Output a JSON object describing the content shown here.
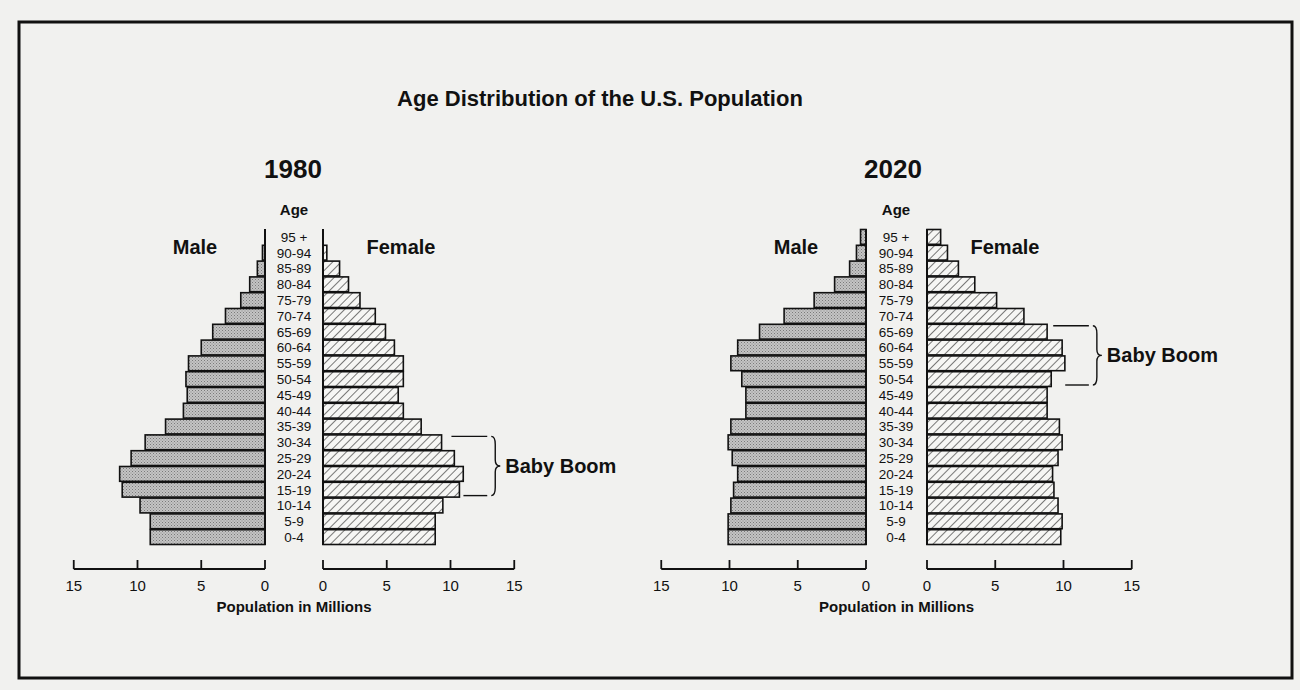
{
  "title": "Age Distribution of the U.S. Population",
  "colors": {
    "background": "#f1f1ef",
    "ink": "#111111",
    "male_fill": "#bdbdbd",
    "female_fill": "#f4f4f2"
  },
  "age_label": "Age",
  "male_label": "Male",
  "female_label": "Female",
  "axis_label": "Population in Millions",
  "annotation_label": "Baby Boom",
  "chart_data": [
    {
      "type": "bar",
      "subtype": "population-pyramid",
      "title": "1980",
      "categories": [
        "95 +",
        "90-94",
        "85-89",
        "80-84",
        "75-79",
        "70-74",
        "65-69",
        "60-64",
        "55-59",
        "50-54",
        "45-49",
        "40-44",
        "35-39",
        "30-34",
        "25-29",
        "20-24",
        "15-19",
        "10-14",
        "5-9",
        "0-4"
      ],
      "series": [
        {
          "name": "Male",
          "values": [
            0.0,
            0.2,
            0.6,
            1.2,
            1.9,
            3.1,
            4.1,
            5.0,
            6.0,
            6.2,
            6.1,
            6.4,
            7.8,
            9.4,
            10.5,
            11.4,
            11.2,
            9.8,
            9.0,
            9.0
          ]
        },
        {
          "name": "Female",
          "values": [
            0.0,
            0.3,
            1.3,
            2.0,
            2.9,
            4.1,
            4.9,
            5.6,
            6.3,
            6.3,
            5.9,
            6.3,
            7.7,
            9.3,
            10.3,
            11.0,
            10.7,
            9.4,
            8.8,
            8.8
          ]
        }
      ],
      "xlabel": "Population in Millions",
      "ylabel": "Age",
      "xlim": [
        0,
        15
      ],
      "xticks": [
        0,
        5,
        10,
        15
      ],
      "grid": false,
      "annotation": {
        "text": "Baby Boom",
        "from": "30-34",
        "to": "15-19",
        "side": "Female"
      }
    },
    {
      "type": "bar",
      "subtype": "population-pyramid",
      "title": "2020",
      "categories": [
        "95 +",
        "90-94",
        "85-89",
        "80-84",
        "75-79",
        "70-74",
        "65-69",
        "60-64",
        "55-59",
        "50-54",
        "45-49",
        "40-44",
        "35-39",
        "30-34",
        "25-29",
        "20-24",
        "15-19",
        "10-14",
        "5-9",
        "0-4"
      ],
      "series": [
        {
          "name": "Male",
          "values": [
            0.4,
            0.7,
            1.2,
            2.3,
            3.8,
            6.0,
            7.8,
            9.4,
            9.9,
            9.1,
            8.8,
            8.8,
            9.9,
            10.1,
            9.8,
            9.4,
            9.7,
            9.9,
            10.1,
            10.1
          ]
        },
        {
          "name": "Female",
          "values": [
            1.0,
            1.5,
            2.3,
            3.5,
            5.1,
            7.1,
            8.8,
            9.9,
            10.1,
            9.1,
            8.8,
            8.8,
            9.7,
            9.9,
            9.6,
            9.2,
            9.3,
            9.6,
            9.9,
            9.8
          ]
        }
      ],
      "xlabel": "Population in Millions",
      "ylabel": "Age",
      "xlim": [
        0,
        15
      ],
      "xticks": [
        0,
        5,
        10,
        15
      ],
      "grid": false,
      "annotation": {
        "text": "Baby Boom",
        "from": "65-69",
        "to": "50-54",
        "side": "Female"
      }
    }
  ]
}
